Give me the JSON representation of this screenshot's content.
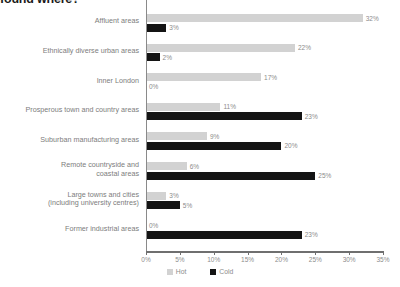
{
  "title": "found where?",
  "legend": {
    "position": "bottom-center",
    "items": [
      {
        "label": "Hot",
        "color": "#d2d2d2",
        "name": "hot"
      },
      {
        "label": "Cold",
        "color": "#141414",
        "name": "cold"
      }
    ]
  },
  "axis": {
    "ticks": [
      "0%",
      "5%",
      "10%",
      "15%",
      "20%",
      "25%",
      "30%",
      "35%"
    ],
    "min": 0,
    "max": 35
  },
  "chart_data": {
    "type": "bar",
    "orientation": "horizontal",
    "title": "found where?",
    "xlabel": "",
    "ylabel": "",
    "xlim": [
      0,
      35
    ],
    "grid": false,
    "legend_position": "bottom-center",
    "tick_labels": [
      "0%",
      "5%",
      "10%",
      "15%",
      "20%",
      "25%",
      "30%",
      "35%"
    ],
    "categories": [
      "Affluent areas",
      "Ethnically diverse urban areas",
      "Inner London",
      "Prosperous town and country areas",
      "Suburban manufacturing areas",
      "Remote countryside and\ncoastal areas",
      "Large towns and cities\n(including university centres)",
      "Former industrial areas"
    ],
    "series": [
      {
        "name": "Hot",
        "color": "#d2d2d2",
        "values": [
          32,
          22,
          17,
          11,
          9,
          6,
          3,
          0
        ],
        "labels": [
          "32%",
          "22%",
          "17%",
          "11%",
          "9%",
          "6%",
          "3%",
          "0%"
        ]
      },
      {
        "name": "Cold",
        "color": "#141414",
        "values": [
          3,
          2,
          0,
          23,
          20,
          25,
          5,
          23
        ],
        "labels": [
          "3%",
          "2%",
          "0%",
          "23%",
          "20%",
          "25%",
          "5%",
          "23%"
        ]
      }
    ]
  }
}
